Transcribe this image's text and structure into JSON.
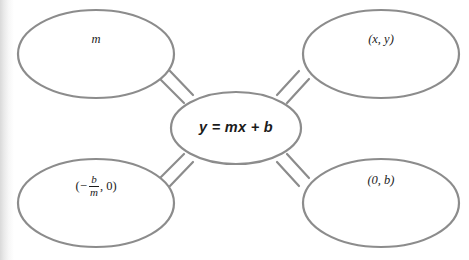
{
  "diagram": {
    "type": "concept-map",
    "center": {
      "id": "center-node",
      "label": "y = mx + b",
      "text_parts": [
        "y",
        "=",
        "mx",
        "+",
        "b"
      ]
    },
    "nodes": [
      {
        "id": "node-slope",
        "position": "top-left",
        "label": "m"
      },
      {
        "id": "node-point",
        "position": "top-right",
        "label": "(x, y)"
      },
      {
        "id": "node-x-intercept",
        "position": "bottom-left",
        "label": "(-b/m, 0)",
        "open_paren": "(",
        "minus": "−",
        "numerator": "b",
        "denominator": "m",
        "tail": ", 0)"
      },
      {
        "id": "node-y-intercept",
        "position": "bottom-right",
        "label": "(0, b)"
      }
    ],
    "connectors": [
      {
        "id": "connector-top-left",
        "from": "center-node",
        "to": "node-slope"
      },
      {
        "id": "connector-top-right",
        "from": "center-node",
        "to": "node-point"
      },
      {
        "id": "connector-bottom-left",
        "from": "center-node",
        "to": "node-x-intercept"
      },
      {
        "id": "connector-bottom-right",
        "from": "center-node",
        "to": "node-y-intercept"
      }
    ],
    "colors": {
      "stroke": "#8c8c8c",
      "fill": "#ffffff",
      "text": "#1b1b1b",
      "background": "#ffffff"
    }
  }
}
